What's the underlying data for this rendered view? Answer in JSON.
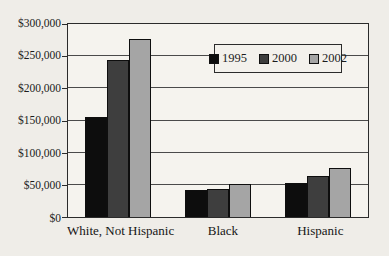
{
  "figure": {
    "background": "#efede8",
    "plot_background": "#f5f3ee",
    "axis_color": "#2b2b2b",
    "gridline_color": "#4a4a4a",
    "text_color": "#1c1c1c"
  },
  "chart_data": {
    "type": "bar",
    "title": "",
    "xlabel": "",
    "ylabel": "",
    "categories": [
      "White, Not Hispanic",
      "Black",
      "Hispanic"
    ],
    "series": [
      {
        "name": "1995",
        "color": "#0d0d0d",
        "values": [
          155000,
          42000,
          53000
        ]
      },
      {
        "name": "2000",
        "color": "#3e3e3e",
        "values": [
          244000,
          43000,
          64000
        ]
      },
      {
        "name": "2002",
        "color": "#a5a5a5",
        "values": [
          277000,
          51000,
          76000
        ]
      }
    ],
    "ylim": [
      0,
      300000
    ],
    "ytick_step": 50000,
    "ytick_labels_bottom_to_top": [
      "$0",
      "$50,000",
      "$100,000",
      "$150,000",
      "$200,000",
      "$250,000",
      "$300,000"
    ],
    "grid": true,
    "legend_position": "top-right-inside"
  }
}
